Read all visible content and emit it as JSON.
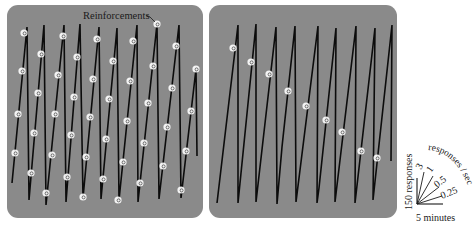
{
  "figure": {
    "annotation": "Reinforcements",
    "legend": {
      "y_scale_label": "150 responses",
      "x_scale_label": "5 minutes",
      "rate_title": "responses / sec",
      "rates": [
        "3",
        "1",
        "0.5",
        "0.25"
      ]
    },
    "colors": {
      "panel": "#8a8a8a",
      "trace": "#0c0c0c",
      "pip": "#f4f4f4",
      "background": "#ffffff"
    }
  },
  "chart_data": [
    {
      "type": "line",
      "title": "Cumulative record – left panel (variable-interval style, pips throughout)",
      "xlabel": "time (scale: 5 minutes)",
      "ylabel": "cumulative responses (scale: 150 responses)",
      "grid": false,
      "legend_position": "right",
      "annotation": {
        "text": "Reinforcements",
        "points_to": [
          157,
          24
        ]
      },
      "trace_px": [
        [
          12,
          183
        ],
        [
          27,
          27
        ],
        [
          29,
          200
        ],
        [
          44,
          25
        ],
        [
          46,
          205
        ],
        [
          64,
          25
        ],
        [
          66,
          202
        ],
        [
          80,
          24
        ],
        [
          83,
          198
        ],
        [
          99,
          27
        ],
        [
          101,
          199
        ],
        [
          117,
          28
        ],
        [
          119,
          200
        ],
        [
          137,
          25
        ],
        [
          138,
          202
        ],
        [
          157,
          24
        ],
        [
          159,
          199
        ],
        [
          179,
          25
        ],
        [
          181,
          198
        ],
        [
          196,
          69
        ],
        [
          197,
          156
        ]
      ],
      "reinforcements_px": [
        [
          15,
          153
        ],
        [
          18,
          114
        ],
        [
          22,
          71
        ],
        [
          24,
          33
        ],
        [
          31,
          173
        ],
        [
          34,
          133
        ],
        [
          38,
          93
        ],
        [
          41,
          54
        ],
        [
          46,
          193
        ],
        [
          52,
          155
        ],
        [
          55,
          114
        ],
        [
          58,
          75
        ],
        [
          63,
          36
        ],
        [
          67,
          177
        ],
        [
          71,
          135
        ],
        [
          74,
          97
        ],
        [
          77,
          57
        ],
        [
          83,
          197
        ],
        [
          86,
          157
        ],
        [
          90,
          117
        ],
        [
          93,
          79
        ],
        [
          97,
          39
        ],
        [
          103,
          179
        ],
        [
          106,
          139
        ],
        [
          109,
          99
        ],
        [
          113,
          61
        ],
        [
          118,
          200
        ],
        [
          123,
          162
        ],
        [
          127,
          121
        ],
        [
          130,
          81
        ],
        [
          133,
          41
        ],
        [
          140,
          183
        ],
        [
          144,
          143
        ],
        [
          148,
          103
        ],
        [
          153,
          66
        ],
        [
          157,
          24
        ],
        [
          163,
          166
        ],
        [
          167,
          127
        ],
        [
          172,
          88
        ],
        [
          176,
          46
        ],
        [
          181,
          190
        ],
        [
          186,
          151
        ],
        [
          191,
          111
        ],
        [
          196,
          69
        ]
      ],
      "segments": 10,
      "resets_per_panel": 9
    },
    {
      "type": "line",
      "title": "Cumulative record – right panel (one reinforcement per excursion, scalloped)",
      "xlabel": "time (scale: 5 minutes)",
      "ylabel": "cumulative responses (scale: 150 responses)",
      "grid": false,
      "trace_px": [
        [
          217,
          203
        ],
        [
          238,
          25
        ],
        [
          238,
          203
        ],
        [
          256,
          24
        ],
        [
          256,
          202
        ],
        [
          276,
          27
        ],
        [
          277,
          204
        ],
        [
          282,
          147
        ],
        [
          295,
          26
        ],
        [
          296,
          202
        ],
        [
          318,
          26
        ],
        [
          317,
          203
        ],
        [
          319,
          188
        ],
        [
          336,
          28
        ],
        [
          335,
          202
        ],
        [
          356,
          26
        ],
        [
          355,
          203
        ],
        [
          375,
          28
        ],
        [
          373,
          200
        ],
        [
          392,
          25
        ],
        [
          391,
          161
        ]
      ],
      "reinforcements_px": [
        [
          233,
          48
        ],
        [
          251,
          62
        ],
        [
          269,
          74
        ],
        [
          288,
          91
        ],
        [
          306,
          106
        ],
        [
          326,
          120
        ],
        [
          342,
          132
        ],
        [
          361,
          151
        ],
        [
          377,
          158
        ]
      ],
      "segments": 9
    },
    {
      "type": "line",
      "title": "Rate legend",
      "rays": [
        {
          "label": "3",
          "rate_responses_per_sec": 3
        },
        {
          "label": "1",
          "rate_responses_per_sec": 1
        },
        {
          "label": "0.5",
          "rate_responses_per_sec": 0.5
        },
        {
          "label": "0.25",
          "rate_responses_per_sec": 0.25
        }
      ],
      "scale": {
        "y": "150 responses",
        "x": "5 minutes"
      },
      "arc_label": "responses / sec"
    }
  ]
}
